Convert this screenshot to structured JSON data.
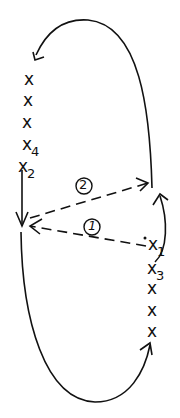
{
  "diagram": {
    "left_points": [
      "x",
      "x",
      "x",
      "x",
      "x"
    ],
    "left_subscripts": {
      "3": "4",
      "4": "2"
    },
    "right_points": [
      "x",
      "x",
      "x",
      "x",
      "x"
    ],
    "right_subscripts": {
      "0": "1",
      "1": "3"
    },
    "arrow_labels": {
      "first": "1",
      "second": "2"
    },
    "labels": {
      "x4": "x",
      "x4_sub": "4",
      "x2": "x",
      "x2_sub": "2",
      "x1": "x",
      "x1_sub": "1",
      "x3": "x",
      "x3_sub": "3"
    },
    "colors": {
      "ink": "#111111",
      "background": "#ffffff"
    }
  }
}
